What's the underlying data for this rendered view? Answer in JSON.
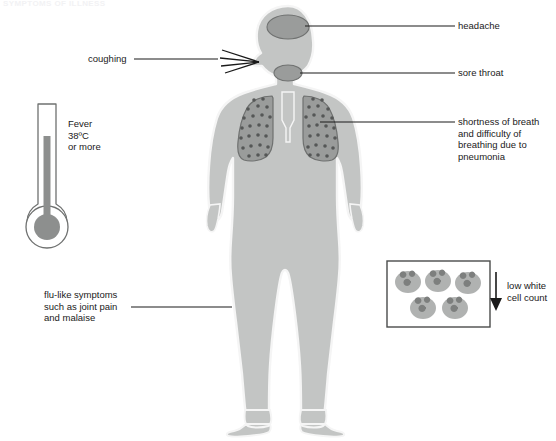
{
  "page": {
    "faint_header": "SYMPTOMS OF ILLNESS",
    "width": 556,
    "height": 441,
    "background": "#ffffff"
  },
  "colors": {
    "body_fill": "#c3c5c4",
    "body_outline": "#f5f5f5",
    "organ_fill": "#9a9c9b",
    "organ_outline": "#6f7170",
    "lung_dot": "#555756",
    "line": "#1a1a1a",
    "text": "#1a1a1a",
    "thermometer_outline": "#6f7170",
    "mercury": "#8d8f8e",
    "cell_fill": "#b0b2b1",
    "cell_nucleus": "#7d7f7e",
    "box_outline": "#4a4c4b"
  },
  "labels": {
    "headache": {
      "text": "headache",
      "x": 458,
      "y": 22
    },
    "sore_throat": {
      "text": "sore throat",
      "x": 458,
      "y": 67
    },
    "pneumonia": {
      "text": "shortness of breath\nand difficulty of\nbreathing due to\npneumonia",
      "x": 458,
      "y": 114
    },
    "coughing": {
      "text": "coughing",
      "x": 88,
      "y": 56
    },
    "fever": {
      "text": "Fever\n38ºC\nor more",
      "x": 68,
      "y": 121
    },
    "flu_like": {
      "text": "flu-like symptoms\nsuch as joint pain\nand malaise",
      "x": 44,
      "y": 291
    },
    "low_white_cell": {
      "text": "low white\ncell count",
      "x": 507,
      "y": 283
    }
  },
  "figure": {
    "name": "human-body-silhouette",
    "organs": [
      {
        "name": "head-region",
        "label_ref": "headache"
      },
      {
        "name": "throat-region",
        "label_ref": "sore_throat"
      },
      {
        "name": "lungs-region",
        "label_ref": "pneumonia"
      }
    ]
  },
  "thermometer": {
    "name": "fever-thermometer",
    "reading_label": "Fever 38ºC or more"
  },
  "white_cells": {
    "name": "white-blood-cell-panel",
    "count": 5,
    "arrow_direction": "down",
    "caption": "low white cell count"
  },
  "cough_marks": {
    "name": "cough-spray-lines",
    "line_count": 4
  }
}
